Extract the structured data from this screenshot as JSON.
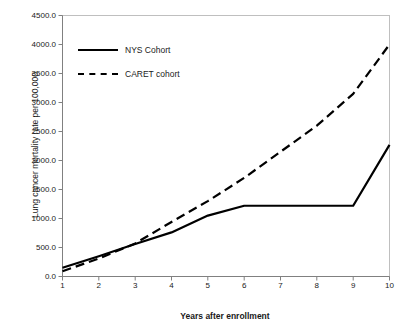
{
  "chart_data": {
    "type": "line",
    "title": "",
    "xlabel": "Years after enrollment",
    "ylabel": "Lung cancer mortality rate per 100,000",
    "x": [
      1,
      2,
      3,
      4,
      5,
      6,
      7,
      8,
      9,
      10
    ],
    "xlim": [
      1,
      10
    ],
    "ylim": [
      0,
      4500
    ],
    "grid": false,
    "legend_position": "top-left-inside",
    "xticklabels": [
      "1",
      "2",
      "3",
      "4",
      "5",
      "6",
      "7",
      "8",
      "9",
      "10"
    ],
    "yticklabels": [
      "0.0",
      "500.0",
      "1000.0",
      "1500.0",
      "2000.0",
      "2500.0",
      "3000.0",
      "3500.0",
      "4000.0",
      "4500.0"
    ],
    "ytickvalues": [
      0,
      500,
      1000,
      1500,
      2000,
      2500,
      3000,
      3500,
      4000,
      4500
    ],
    "series": [
      {
        "name": "NYS Cohort",
        "style": "solid",
        "color": "#000000",
        "values": [
          150,
          350,
          560,
          760,
          1050,
          1220,
          1220,
          1220,
          1220,
          2270
        ]
      },
      {
        "name": "CARET cohort",
        "style": "dashed",
        "color": "#000000",
        "values": [
          90,
          310,
          570,
          940,
          1300,
          1700,
          2150,
          2600,
          3150,
          4000
        ]
      }
    ]
  }
}
